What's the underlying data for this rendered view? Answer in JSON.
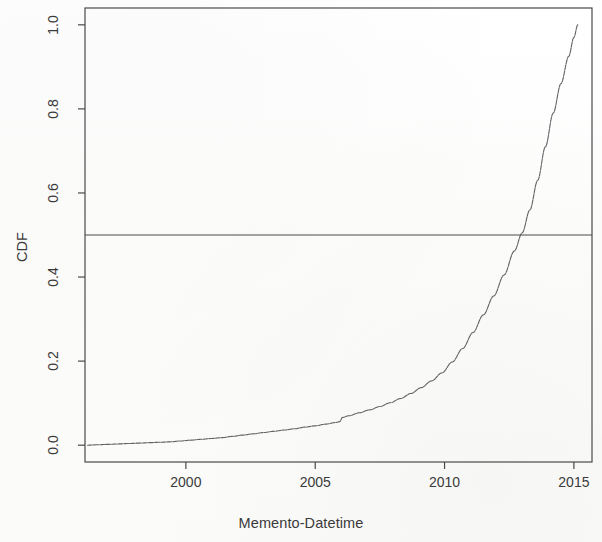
{
  "chart_data": {
    "type": "line",
    "title": "",
    "subtitle": "",
    "xlabel": "Memento-Datetime",
    "ylabel": "CDF",
    "xlim": [
      1996.1,
      2015.7
    ],
    "ylim": [
      -0.04,
      1.04
    ],
    "xticks": [
      2000,
      2005,
      2010,
      2015
    ],
    "xtick_labels": [
      "2000",
      "2005",
      "2010",
      "2015"
    ],
    "yticks": [
      0.0,
      0.2,
      0.4,
      0.6,
      0.8,
      1.0
    ],
    "ytick_labels": [
      "0.0",
      "0.2",
      "0.4",
      "0.6",
      "0.8",
      "1.0"
    ],
    "grid": false,
    "legend": null,
    "legend_position": "none",
    "frame": "box",
    "line_color": "#555555",
    "line_width": 1.1,
    "reference_lines": [
      {
        "name": "median-line",
        "orientation": "horizontal",
        "y": 0.5,
        "color": "#4a4a4a",
        "width": 1.1,
        "label": ""
      }
    ],
    "annotations": [],
    "series": [
      {
        "name": "CDF of Memento-Datetime",
        "x": [
          1996.2,
          1996.6,
          1997.0,
          1997.4,
          1997.8,
          1998.2,
          1998.6,
          1999.0,
          1999.4,
          1999.8,
          2000.2,
          2000.6,
          2001.0,
          2001.4,
          2001.8,
          2002.2,
          2002.6,
          2003.0,
          2003.4,
          2003.8,
          2004.2,
          2004.6,
          2005.0,
          2005.4,
          2005.8,
          2005.95,
          2006.05,
          2006.3,
          2006.7,
          2007.1,
          2007.5,
          2007.9,
          2008.3,
          2008.7,
          2009.1,
          2009.5,
          2009.9,
          2010.3,
          2010.7,
          2011.1,
          2011.5,
          2011.9,
          2012.3,
          2012.7,
          2013.0,
          2013.3,
          2013.6,
          2013.9,
          2014.2,
          2014.5,
          2014.8,
          2015.0,
          2015.15
        ],
        "y": [
          0.0,
          0.001,
          0.002,
          0.003,
          0.004,
          0.005,
          0.006,
          0.007,
          0.008,
          0.01,
          0.012,
          0.014,
          0.016,
          0.018,
          0.021,
          0.024,
          0.027,
          0.03,
          0.033,
          0.036,
          0.039,
          0.043,
          0.046,
          0.05,
          0.054,
          0.056,
          0.066,
          0.07,
          0.077,
          0.084,
          0.092,
          0.101,
          0.111,
          0.123,
          0.137,
          0.153,
          0.172,
          0.198,
          0.23,
          0.268,
          0.31,
          0.355,
          0.405,
          0.462,
          0.505,
          0.56,
          0.63,
          0.71,
          0.79,
          0.86,
          0.925,
          0.97,
          1.0
        ]
      }
    ],
    "median_crossing": {
      "x": 2013.0,
      "y": 0.5
    }
  },
  "figure": {
    "background_color": "#ffffff",
    "axis_color": "#4a4a4a",
    "text_color": "#3a3a3a"
  }
}
